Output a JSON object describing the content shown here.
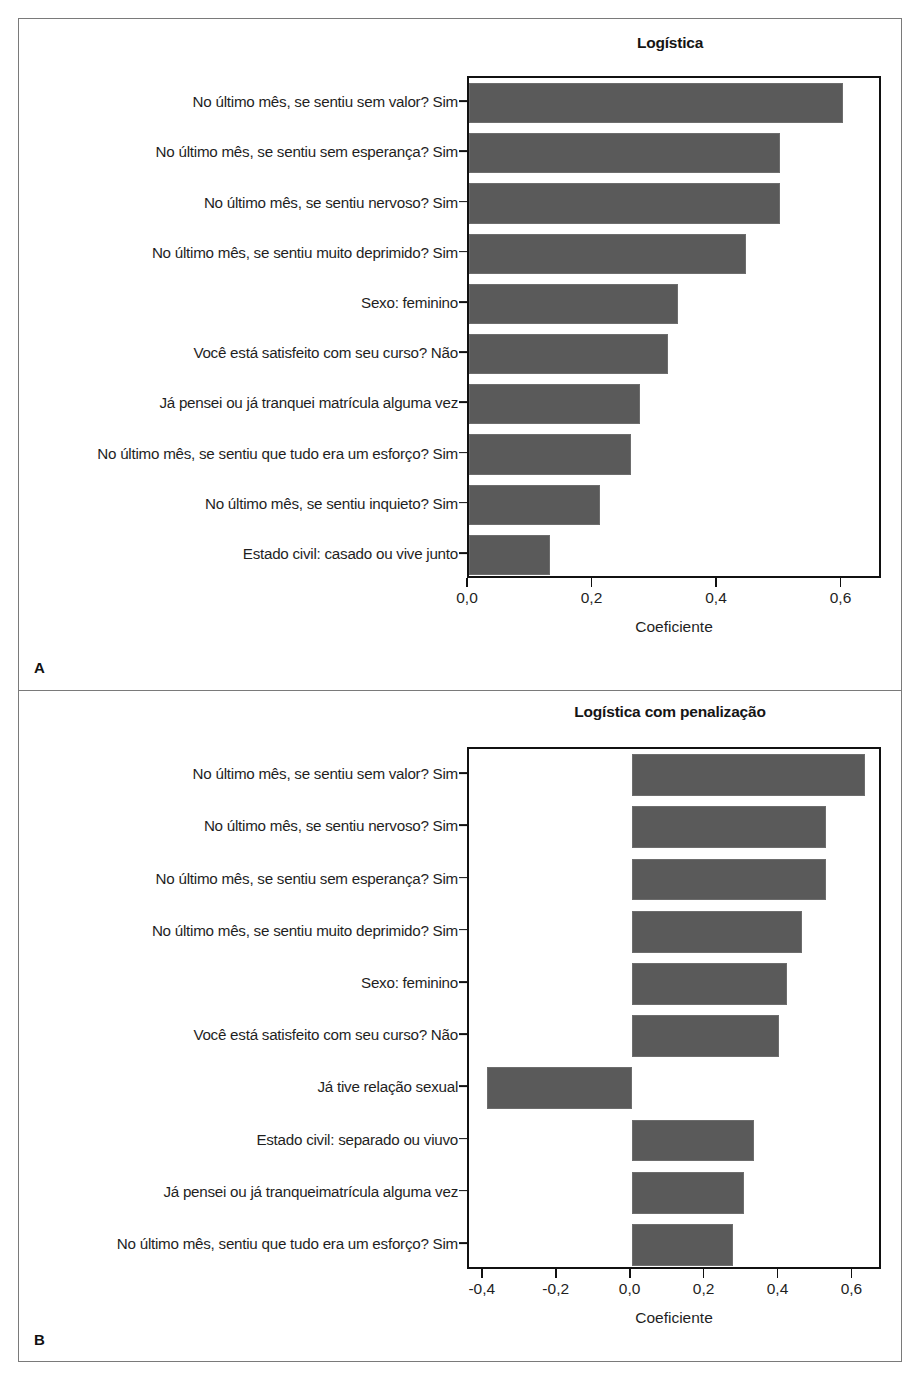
{
  "figure": {
    "panels": [
      {
        "letter": "A",
        "title": "Logística",
        "xlabel": "Coeficiente"
      },
      {
        "letter": "B",
        "title": "Logística com penalização",
        "xlabel": "Coeficiente"
      }
    ]
  },
  "chart_data": [
    {
      "type": "bar",
      "orientation": "horizontal",
      "panel": "A",
      "title": "Logística",
      "xlabel": "Coeficiente",
      "ylabel": "",
      "xlim": [
        0.0,
        0.665
      ],
      "xticks": [
        0.0,
        0.2,
        0.4,
        0.6
      ],
      "xticklabels": [
        "0,0",
        "0,2",
        "0,4",
        "0,6"
      ],
      "grid": false,
      "legend": null,
      "bar_color": "#5a5a5a",
      "categories": [
        "No último mês, se sentiu sem valor? Sim",
        "No último mês, se sentiu sem esperança? Sim",
        "No último mês, se sentiu nervoso? Sim",
        "No último mês, se sentiu muito deprimido? Sim",
        "Sexo: feminino",
        "Você está satisfeito com seu curso? Não",
        "Já pensei ou já tranquei matrícula alguma vez",
        "No último mês, se sentiu que tudo era um esforço? Sim",
        "No último mês, se sentiu inquieto? Sim",
        "Estado civil: casado ou vive junto"
      ],
      "values": [
        0.6,
        0.5,
        0.5,
        0.445,
        0.335,
        0.32,
        0.275,
        0.26,
        0.21,
        0.13
      ]
    },
    {
      "type": "bar",
      "orientation": "horizontal",
      "panel": "B",
      "title": "Logística com penalização",
      "xlabel": "Coeficiente",
      "ylabel": "",
      "xlim": [
        -0.44,
        0.68
      ],
      "xticks": [
        -0.4,
        -0.2,
        0.0,
        0.2,
        0.4,
        0.6
      ],
      "xticklabels": [
        "-0,4",
        "-0,2",
        "0,0",
        "0,2",
        "0,4",
        "0,6"
      ],
      "grid": false,
      "legend": null,
      "bar_color": "#5a5a5a",
      "categories": [
        "No último mês, se sentiu sem valor? Sim",
        "No último mês, se sentiu nervoso? Sim",
        "No último mês, se sentiu sem esperança? Sim",
        "No último mês, se sentiu muito deprimido? Sim",
        "Sexo: feminino",
        "Você está satisfeito com seu curso? Não",
        "Já tive relação sexual",
        "Estado civil: separado ou viuvo",
        "Já pensei ou já tranqueimatrícula alguma vez",
        "No último mês, sentiu que tudo era um esforço? Sim"
      ],
      "values": [
        0.63,
        0.525,
        0.525,
        0.46,
        0.42,
        0.4,
        -0.39,
        0.33,
        0.305,
        0.275
      ]
    }
  ]
}
